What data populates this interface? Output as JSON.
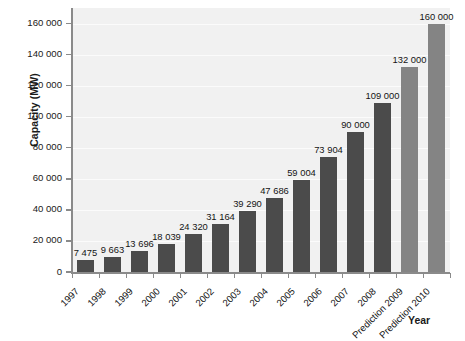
{
  "chart_data": {
    "type": "bar",
    "title": "",
    "subtitle": "",
    "xlabel": "Year",
    "ylabel": "Capacity (MW)",
    "ylim": [
      0,
      170000
    ],
    "grid": true,
    "legend": false,
    "legend_position": "none",
    "categories": [
      "1997",
      "1998",
      "1999",
      "2000",
      "2001",
      "2002",
      "2003",
      "2004",
      "2005",
      "2006",
      "2007",
      "2008",
      "Prediction 2009",
      "Prediction 2010"
    ],
    "values": [
      7475,
      9663,
      13696,
      18039,
      24320,
      31164,
      39290,
      47686,
      59004,
      73904,
      90000,
      109000,
      132000,
      160000
    ],
    "data_labels": [
      "7 475",
      "9 663",
      "13 696",
      "18 039",
      "24 320",
      "31 164",
      "39 290",
      "47 686",
      "59 004",
      "73 904",
      "90 000",
      "109 000",
      "132 000",
      "160 000"
    ],
    "series_kind": [
      "historical",
      "historical",
      "historical",
      "historical",
      "historical",
      "historical",
      "historical",
      "historical",
      "historical",
      "historical",
      "historical",
      "historical",
      "prediction",
      "prediction"
    ],
    "ytick_values": [
      0,
      20000,
      40000,
      60000,
      80000,
      100000,
      120000,
      140000,
      160000
    ],
    "ytick_labels": [
      "0",
      "20 000",
      "40 000",
      "60 000",
      "80 000",
      "100 000",
      "120 000",
      "140 000",
      "160 000"
    ],
    "colors": {
      "historical_bar": "#4b4b4b",
      "prediction_bar": "#848484",
      "plot_background": "#f1f1f1",
      "gridline": "#fbfbfb",
      "axis_line": "#8a8a8a",
      "text": "#141414",
      "page_background": "#ffffff"
    }
  }
}
